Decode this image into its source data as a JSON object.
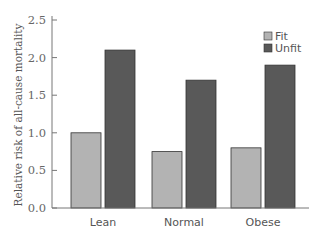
{
  "chart_data": {
    "type": "bar",
    "title": "",
    "xlabel": "",
    "ylabel": "Relative risk of all-cause mortality",
    "categories": [
      "Lean",
      "Normal",
      "Obese"
    ],
    "series": [
      {
        "name": "Fit",
        "values": [
          1.0,
          0.75,
          0.8
        ],
        "color": "#b3b3b3"
      },
      {
        "name": "Unfit",
        "values": [
          2.1,
          1.7,
          1.9
        ],
        "color": "#595959"
      }
    ],
    "ylim": [
      0,
      2.5
    ],
    "yticks": [
      0.0,
      0.5,
      1.0,
      1.5,
      2.0,
      2.5
    ],
    "ytick_labels": [
      "0.0",
      "0.5",
      "1.0",
      "1.5",
      "2.0",
      "2.5"
    ],
    "grid": false,
    "legend_position": "top-right"
  }
}
